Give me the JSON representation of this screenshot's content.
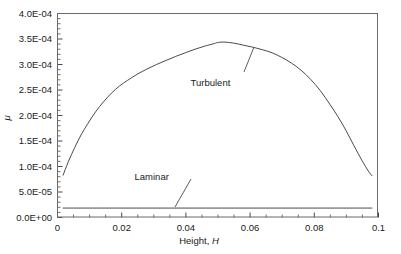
{
  "chart_data": {
    "type": "line",
    "title": "",
    "xlabel": "Height, H",
    "ylabel": "μ",
    "xlim": [
      0,
      0.1
    ],
    "ylim": [
      0,
      0.0004
    ],
    "grid": false,
    "legend_position": "none",
    "x_ticks": [
      "0",
      "0.02",
      "0.04",
      "0.06",
      "0.08",
      "0.1"
    ],
    "x_tick_values": [
      0,
      0.02,
      0.04,
      0.06,
      0.08,
      0.1
    ],
    "x_minor_ticks_per_interval": 4,
    "y_ticks": [
      "0.0E+00",
      "5.0E-05",
      "1.0E-04",
      "1.5E-04",
      "2.0E-04",
      "2.5E-04",
      "3.0E-04",
      "3.5E-04",
      "4.0E-04"
    ],
    "y_tick_values": [
      0,
      5e-05,
      0.0001,
      0.00015,
      0.0002,
      0.00025,
      0.0003,
      0.00035,
      0.0004
    ],
    "y_minor_ticks_per_interval": 5,
    "series": [
      {
        "name": "Turbulent",
        "color": "#4a4a4a",
        "x": [
          0.0019,
          0.0035,
          0.0055,
          0.0075,
          0.0095,
          0.012,
          0.0145,
          0.017,
          0.0195,
          0.022,
          0.025,
          0.028,
          0.031,
          0.034,
          0.037,
          0.04,
          0.043,
          0.046,
          0.049,
          0.05,
          0.052,
          0.055,
          0.058,
          0.061,
          0.064,
          0.067,
          0.07,
          0.073,
          0.076,
          0.079,
          0.082,
          0.085,
          0.0875,
          0.09,
          0.0925,
          0.095,
          0.097,
          0.0981
        ],
        "y": [
          8.2e-05,
          0.000108,
          0.000136,
          0.000161,
          0.000182,
          0.000206,
          0.000226,
          0.000243,
          0.000257,
          0.000268,
          0.00028,
          0.00029,
          0.000299,
          0.000307,
          0.000315,
          0.000322,
          0.000329,
          0.000335,
          0.00034,
          0.000342,
          0.000343,
          0.000341,
          0.000337,
          0.000333,
          0.000328,
          0.000322,
          0.000313,
          0.000302,
          0.000288,
          0.00027,
          0.000248,
          0.000221,
          0.000197,
          0.00017,
          0.00014,
          0.000111,
          9e-05,
          8.1e-05
        ]
      },
      {
        "name": "Laminar",
        "color": "#4a4a4a",
        "x": [
          0.0019,
          0.02,
          0.04,
          0.06,
          0.08,
          0.0981
        ],
        "y": [
          1.75e-05,
          1.75e-05,
          1.75e-05,
          1.75e-05,
          1.75e-05,
          1.75e-05
        ]
      }
    ],
    "annotations": [
      {
        "text": "Turbulent",
        "text_x": 0.0478,
        "text_y": 0.000256,
        "leader_from_x": 0.0441,
        "leader_from_y": 0.0002795,
        "leader_to_x": 0.0598,
        "leader_from_pix": [
          244,
          72
        ],
        "leader_to_pix": [
          254,
          47
        ]
      },
      {
        "text": "Laminar",
        "text_x": 0.0295,
        "text_y": 7.3e-05,
        "leader_from_pix": [
          175,
          207
        ],
        "leader_to_pix": [
          191,
          179
        ]
      }
    ]
  },
  "plot_area": {
    "left_px": 57,
    "right_px": 378,
    "top_px": 13,
    "bottom_px": 217
  }
}
